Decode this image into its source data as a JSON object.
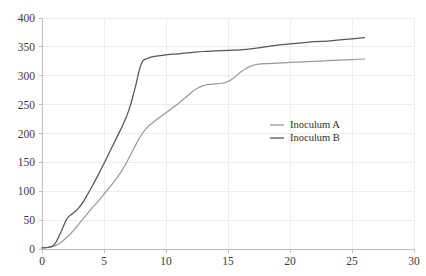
{
  "chart_data": {
    "type": "line",
    "title": "",
    "subtitle": "",
    "xlabel": "",
    "ylabel": "",
    "xlim": [
      0,
      30
    ],
    "ylim": [
      0,
      400
    ],
    "xticks": [
      0,
      5,
      10,
      15,
      20,
      25,
      30
    ],
    "yticks": [
      0,
      50,
      100,
      150,
      200,
      250,
      300,
      350,
      400
    ],
    "xtick_labels": [
      "0",
      "5",
      "10",
      "15",
      "20",
      "25",
      "30"
    ],
    "ytick_labels": [
      "0",
      "50",
      "100",
      "150",
      "200",
      "250",
      "300",
      "350",
      "400"
    ],
    "grid": true,
    "grid_axis": "both",
    "legend_position": "center-right",
    "legend_entries": [
      "Inoculum A",
      "Inoculum B"
    ],
    "series": [
      {
        "name": "Inoculum A",
        "color": "#9a9a9e",
        "x": [
          0,
          0.5,
          1,
          1.5,
          2,
          2.5,
          3,
          3.5,
          4,
          4.5,
          5,
          5.5,
          6,
          6.5,
          7,
          7.5,
          8,
          8.5,
          9,
          9.5,
          10,
          10.5,
          11,
          11.5,
          12,
          12.5,
          13,
          13.5,
          14,
          14.5,
          15,
          15.5,
          16,
          16.5,
          17,
          17.5,
          18,
          19,
          20,
          21,
          22,
          23,
          24,
          25,
          26
        ],
        "values": [
          2,
          3,
          5,
          11,
          20,
          31,
          44,
          57,
          70,
          82,
          95,
          108,
          122,
          138,
          157,
          178,
          197,
          211,
          220,
          228,
          236,
          244,
          252,
          261,
          270,
          278,
          283,
          285,
          286,
          287,
          290,
          297,
          306,
          313,
          318,
          320,
          321,
          322,
          323,
          324,
          325,
          326,
          327,
          328,
          329
        ]
      },
      {
        "name": "Inoculum B",
        "color": "#555559",
        "x": [
          0,
          0.5,
          1,
          1.5,
          2,
          2.5,
          3,
          3.5,
          4,
          4.5,
          5,
          5.5,
          6,
          6.5,
          7,
          7.5,
          8,
          8.5,
          9,
          10,
          11,
          12,
          13,
          14,
          15,
          16,
          17,
          18,
          19,
          20,
          21,
          22,
          23,
          24,
          25,
          26
        ],
        "values": [
          2,
          3,
          8,
          28,
          52,
          62,
          72,
          88,
          107,
          127,
          148,
          170,
          192,
          214,
          240,
          278,
          320,
          330,
          333,
          336,
          338,
          340,
          342,
          343,
          344,
          345,
          347,
          350,
          353,
          355,
          357,
          359,
          360,
          362,
          364,
          366
        ]
      }
    ]
  },
  "axes": {
    "plot_left": 42,
    "plot_right": 414,
    "plot_top": 18,
    "plot_bottom": 249
  },
  "legend": {
    "x": 270,
    "y_first": 125,
    "row_gap": 13,
    "swatch_width": 14,
    "label_offset": 20
  }
}
